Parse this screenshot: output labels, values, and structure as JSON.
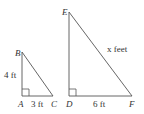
{
  "diagram": {
    "small_triangle": {
      "vertices": {
        "A": "A",
        "B": "B",
        "C": "C"
      },
      "side_AB": "4 ft",
      "side_AC": "3 ft",
      "right_angle_at": "A"
    },
    "large_triangle": {
      "vertices": {
        "D": "D",
        "E": "E",
        "F": "F"
      },
      "side_DF": "6 ft",
      "side_EF": "x feet",
      "right_angle_at": "D"
    },
    "colors": {
      "line": "#555555",
      "text": "#333333",
      "background": "#ffffff"
    }
  }
}
